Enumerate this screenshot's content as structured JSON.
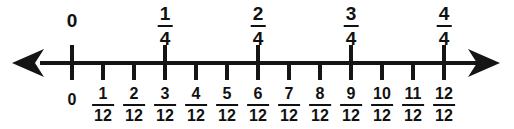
{
  "figure": {
    "background_color": "#ffffff",
    "line_color": "#151515",
    "text_color": "#111111"
  },
  "chart_data": {
    "type": "number-line",
    "xlabel": "",
    "ylabel": "",
    "xlim": [
      0,
      1
    ],
    "grid": false,
    "legend": "none",
    "axis": {
      "left_arrow": true,
      "right_arrow": true,
      "orientation": "horizontal"
    },
    "tick_spacing_fraction": "1/12",
    "major_every": 3,
    "series": [
      {
        "name": "fourths",
        "position": "above",
        "values": [
          0,
          0.25,
          0.5,
          0.75,
          1
        ],
        "labels": [
          {
            "kind": "whole",
            "text": "0",
            "numerator": "",
            "denominator": ""
          },
          {
            "kind": "fraction",
            "text": "1/4",
            "numerator": "1",
            "denominator": "4"
          },
          {
            "kind": "fraction",
            "text": "2/4",
            "numerator": "2",
            "denominator": "4"
          },
          {
            "kind": "fraction",
            "text": "3/4",
            "numerator": "3",
            "denominator": "4"
          },
          {
            "kind": "fraction",
            "text": "4/4",
            "numerator": "4",
            "denominator": "4"
          }
        ]
      },
      {
        "name": "twelfths",
        "position": "below",
        "values": [
          0,
          0.0833,
          0.1667,
          0.25,
          0.3333,
          0.4167,
          0.5,
          0.5833,
          0.6667,
          0.75,
          0.8333,
          0.9167,
          1
        ],
        "labels": [
          {
            "kind": "whole",
            "text": "0",
            "numerator": "",
            "denominator": ""
          },
          {
            "kind": "fraction",
            "text": "1/12",
            "numerator": "1",
            "denominator": "12"
          },
          {
            "kind": "fraction",
            "text": "2/12",
            "numerator": "2",
            "denominator": "12"
          },
          {
            "kind": "fraction",
            "text": "3/12",
            "numerator": "3",
            "denominator": "12"
          },
          {
            "kind": "fraction",
            "text": "4/12",
            "numerator": "4",
            "denominator": "12"
          },
          {
            "kind": "fraction",
            "text": "5/12",
            "numerator": "5",
            "denominator": "12"
          },
          {
            "kind": "fraction",
            "text": "6/12",
            "numerator": "6",
            "denominator": "12"
          },
          {
            "kind": "fraction",
            "text": "7/12",
            "numerator": "7",
            "denominator": "12"
          },
          {
            "kind": "fraction",
            "text": "8/12",
            "numerator": "8",
            "denominator": "12"
          },
          {
            "kind": "fraction",
            "text": "9/12",
            "numerator": "9",
            "denominator": "12"
          },
          {
            "kind": "fraction",
            "text": "10/12",
            "numerator": "10",
            "denominator": "12"
          },
          {
            "kind": "fraction",
            "text": "11/12",
            "numerator": "11",
            "denominator": "12"
          },
          {
            "kind": "fraction",
            "text": "12/12",
            "numerator": "12",
            "denominator": "12"
          }
        ]
      }
    ]
  },
  "geometry": {
    "origin_x": 72,
    "step_px": 31,
    "axis_y": 61
  }
}
